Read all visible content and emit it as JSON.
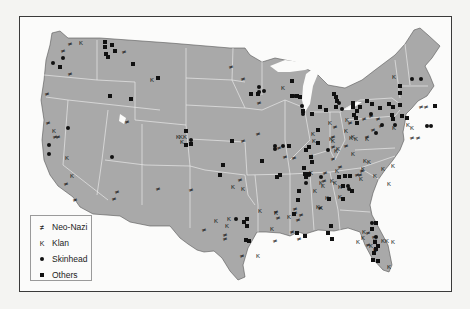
{
  "map": {
    "subject": "Distribution of hate groups in the contiguous United States",
    "colors": {
      "land": "#a9a9a9",
      "state_border": "#e8e8e8",
      "water": "#fbfbfa",
      "frame": "#3a3a3a",
      "marker": "#111111"
    }
  },
  "legend": {
    "items": [
      {
        "key": "neo_nazi",
        "label": "Neo-Nazi",
        "symbol": "neo-nazi-symbol",
        "glyph": "≠"
      },
      {
        "key": "klan",
        "label": "Klan",
        "symbol": "k-letter",
        "glyph": "K"
      },
      {
        "key": "skinhead",
        "label": "Skinhead",
        "symbol": "filled-circle"
      },
      {
        "key": "others",
        "label": "Others",
        "symbol": "filled-square"
      }
    ]
  },
  "markers": {
    "neo_nazi": [
      [
        70,
        43
      ],
      [
        63,
        50
      ],
      [
        70,
        73
      ],
      [
        47,
        93
      ],
      [
        48,
        122
      ],
      [
        55,
        136
      ],
      [
        58,
        136
      ],
      [
        66,
        183
      ],
      [
        75,
        199
      ],
      [
        117,
        191
      ],
      [
        114,
        198
      ],
      [
        127,
        121
      ],
      [
        231,
        66
      ],
      [
        259,
        102
      ],
      [
        258,
        133
      ],
      [
        243,
        140
      ],
      [
        279,
        147
      ],
      [
        285,
        156
      ],
      [
        294,
        157
      ],
      [
        311,
        155
      ],
      [
        333,
        136
      ],
      [
        335,
        126
      ],
      [
        350,
        122
      ],
      [
        371,
        115
      ],
      [
        378,
        118
      ],
      [
        381,
        125
      ],
      [
        367,
        136
      ],
      [
        373,
        129
      ],
      [
        295,
        208
      ],
      [
        295,
        212
      ],
      [
        298,
        219
      ],
      [
        276,
        211
      ],
      [
        278,
        217
      ],
      [
        275,
        240
      ],
      [
        292,
        231
      ],
      [
        301,
        214
      ],
      [
        421,
        106
      ],
      [
        426,
        106
      ],
      [
        412,
        137
      ],
      [
        418,
        137
      ],
      [
        357,
        174
      ],
      [
        360,
        174
      ],
      [
        325,
        172
      ],
      [
        333,
        158
      ],
      [
        240,
        179
      ],
      [
        191,
        189
      ],
      [
        158,
        188
      ],
      [
        124,
        51
      ],
      [
        333,
        146
      ],
      [
        346,
        145
      ],
      [
        324,
        180
      ],
      [
        320,
        207
      ],
      [
        340,
        166
      ],
      [
        362,
        170
      ],
      [
        364,
        118
      ],
      [
        243,
        78
      ],
      [
        242,
        255
      ],
      [
        204,
        229
      ],
      [
        225,
        234
      ],
      [
        225,
        238
      ],
      [
        368,
        232
      ],
      [
        374,
        236
      ],
      [
        368,
        244
      ],
      [
        299,
        238
      ]
    ],
    "klan": [
      [
        81,
        42
      ],
      [
        152,
        79
      ],
      [
        283,
        87
      ],
      [
        54,
        130
      ],
      [
        67,
        157
      ],
      [
        72,
        175
      ],
      [
        178,
        136
      ],
      [
        181,
        136
      ],
      [
        185,
        136
      ],
      [
        182,
        141
      ],
      [
        233,
        186
      ],
      [
        243,
        188
      ],
      [
        216,
        220
      ],
      [
        229,
        218
      ],
      [
        227,
        225
      ],
      [
        258,
        255
      ],
      [
        260,
        210
      ],
      [
        272,
        228
      ],
      [
        276,
        212
      ],
      [
        289,
        216
      ],
      [
        313,
        133
      ],
      [
        314,
        140
      ],
      [
        331,
        138
      ],
      [
        333,
        140
      ],
      [
        338,
        148
      ],
      [
        336,
        150
      ],
      [
        346,
        130
      ],
      [
        356,
        138
      ],
      [
        351,
        137
      ],
      [
        367,
        138
      ],
      [
        394,
        76
      ],
      [
        394,
        127
      ],
      [
        408,
        124
      ],
      [
        412,
        127
      ],
      [
        330,
        122
      ],
      [
        347,
        119
      ],
      [
        311,
        172
      ],
      [
        337,
        170
      ],
      [
        323,
        185
      ],
      [
        315,
        190
      ],
      [
        321,
        182
      ],
      [
        335,
        182
      ],
      [
        340,
        186
      ],
      [
        361,
        178
      ],
      [
        353,
        153
      ],
      [
        353,
        136
      ],
      [
        363,
        168
      ],
      [
        369,
        161
      ],
      [
        375,
        175
      ],
      [
        383,
        168
      ],
      [
        393,
        165
      ],
      [
        318,
        206
      ],
      [
        327,
        197
      ],
      [
        321,
        207
      ],
      [
        340,
        196
      ],
      [
        332,
        180
      ],
      [
        365,
        160
      ],
      [
        389,
        183
      ],
      [
        358,
        241
      ],
      [
        364,
        231
      ],
      [
        383,
        240
      ],
      [
        387,
        240
      ],
      [
        393,
        241
      ],
      [
        375,
        249
      ],
      [
        389,
        266
      ],
      [
        375,
        240
      ],
      [
        371,
        245
      ],
      [
        363,
        237
      ]
    ],
    "skinhead": [
      [
        53,
        63
      ],
      [
        63,
        58
      ],
      [
        49,
        145
      ],
      [
        49,
        154
      ],
      [
        68,
        128
      ],
      [
        112,
        157
      ],
      [
        191,
        140
      ],
      [
        259,
        87
      ],
      [
        259,
        92
      ],
      [
        264,
        91
      ],
      [
        275,
        146
      ],
      [
        283,
        146
      ],
      [
        275,
        149
      ],
      [
        292,
        96
      ],
      [
        294,
        96
      ],
      [
        302,
        106
      ],
      [
        303,
        114
      ],
      [
        339,
        103
      ],
      [
        342,
        109
      ],
      [
        371,
        114
      ],
      [
        376,
        133
      ],
      [
        382,
        125
      ],
      [
        395,
        125
      ],
      [
        412,
        79
      ],
      [
        421,
        79
      ],
      [
        427,
        126
      ],
      [
        431,
        126
      ],
      [
        328,
        150
      ],
      [
        321,
        177
      ],
      [
        348,
        186
      ],
      [
        236,
        219
      ],
      [
        306,
        183
      ],
      [
        309,
        175
      ],
      [
        372,
        223
      ],
      [
        372,
        229
      ],
      [
        349,
        189
      ],
      [
        376,
        237
      ]
    ],
    "others": [
      [
        105,
        42
      ],
      [
        112,
        45
      ],
      [
        105,
        47
      ],
      [
        115,
        51
      ],
      [
        106,
        54
      ],
      [
        108,
        57
      ],
      [
        133,
        64
      ],
      [
        60,
        67
      ],
      [
        158,
        78
      ],
      [
        110,
        96
      ],
      [
        131,
        99
      ],
      [
        186,
        131
      ],
      [
        186,
        145
      ],
      [
        191,
        144
      ],
      [
        251,
        94
      ],
      [
        258,
        94
      ],
      [
        292,
        81
      ],
      [
        223,
        165
      ],
      [
        220,
        175
      ],
      [
        232,
        141
      ],
      [
        262,
        161
      ],
      [
        292,
        96
      ],
      [
        297,
        96
      ],
      [
        300,
        97
      ],
      [
        303,
        111
      ],
      [
        312,
        114
      ],
      [
        320,
        107
      ],
      [
        334,
        94
      ],
      [
        336,
        97
      ],
      [
        337,
        101
      ],
      [
        326,
        110
      ],
      [
        336,
        107
      ],
      [
        353,
        107
      ],
      [
        354,
        115
      ],
      [
        357,
        111
      ],
      [
        360,
        107
      ],
      [
        367,
        101
      ],
      [
        372,
        104
      ],
      [
        380,
        108
      ],
      [
        389,
        104
      ],
      [
        393,
        107
      ],
      [
        392,
        115
      ],
      [
        393,
        119
      ],
      [
        400,
        86
      ],
      [
        400,
        93
      ],
      [
        400,
        105
      ],
      [
        402,
        116
      ],
      [
        407,
        118
      ],
      [
        435,
        106
      ],
      [
        318,
        130
      ],
      [
        306,
        150
      ],
      [
        311,
        157
      ],
      [
        312,
        162
      ],
      [
        304,
        168
      ],
      [
        305,
        174
      ],
      [
        309,
        174
      ],
      [
        353,
        103
      ],
      [
        356,
        118
      ],
      [
        357,
        123
      ],
      [
        339,
        177
      ],
      [
        345,
        176
      ],
      [
        350,
        176
      ],
      [
        343,
        186
      ],
      [
        352,
        191
      ],
      [
        343,
        199
      ],
      [
        329,
        199
      ],
      [
        331,
        226
      ],
      [
        328,
        233
      ],
      [
        332,
        239
      ],
      [
        244,
        222
      ],
      [
        247,
        219
      ],
      [
        247,
        226
      ],
      [
        246,
        240
      ],
      [
        249,
        241
      ],
      [
        372,
        229
      ],
      [
        376,
        223
      ],
      [
        375,
        242
      ],
      [
        374,
        253
      ],
      [
        373,
        260
      ],
      [
        378,
        246
      ],
      [
        378,
        261
      ],
      [
        376,
        249
      ],
      [
        305,
        236
      ],
      [
        277,
        177
      ],
      [
        280,
        175
      ],
      [
        289,
        146
      ],
      [
        297,
        233
      ],
      [
        309,
        147
      ],
      [
        318,
        143
      ],
      [
        299,
        191
      ],
      [
        298,
        200
      ],
      [
        306,
        177
      ],
      [
        294,
        214
      ]
    ]
  }
}
